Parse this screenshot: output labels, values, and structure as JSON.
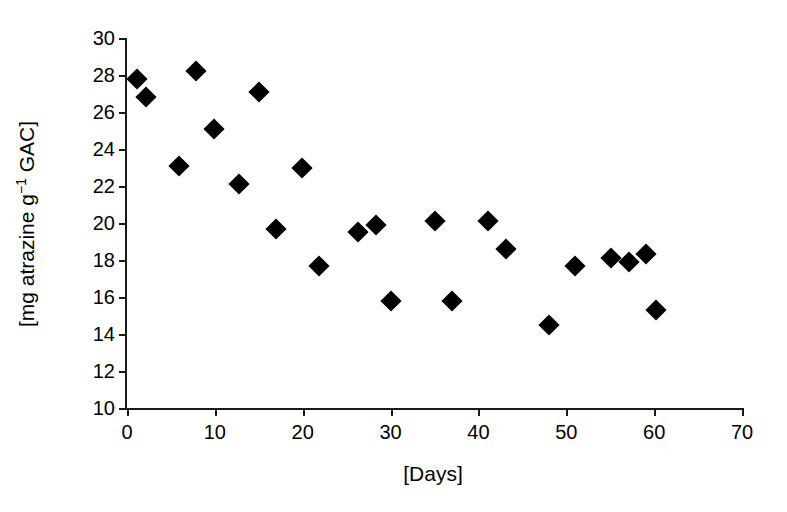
{
  "chart_data": {
    "type": "scatter",
    "title": "",
    "xlabel": "[Days]",
    "ylabel_parts": {
      "prefix": "[mg atrazine g",
      "superscript": "−1",
      "suffix": " GAC]"
    },
    "ylabel": "[mg atrazine g −1 GAC]",
    "xlim": [
      0,
      70
    ],
    "ylim": [
      10,
      30
    ],
    "xticks": [
      0,
      10,
      20,
      30,
      40,
      50,
      60,
      70
    ],
    "yticks": [
      10,
      12,
      14,
      16,
      18,
      20,
      22,
      24,
      26,
      28,
      30
    ],
    "xtick_labels": [
      "0",
      "10",
      "20",
      "30",
      "40",
      "50",
      "60",
      "70"
    ],
    "ytick_labels": [
      "10",
      "12",
      "14",
      "16",
      "18",
      "20",
      "22",
      "24",
      "26",
      "28",
      "30"
    ],
    "grid": false,
    "legend": null,
    "marker": {
      "shape": "diamond",
      "color": "#000000",
      "size": 15
    },
    "series": [
      {
        "name": "atrazine loading",
        "color": "#000000",
        "points": [
          {
            "x": 1.1,
            "y": 27.8
          },
          {
            "x": 2.2,
            "y": 26.8
          },
          {
            "x": 5.9,
            "y": 23.1
          },
          {
            "x": 7.9,
            "y": 28.2
          },
          {
            "x": 9.9,
            "y": 25.1
          },
          {
            "x": 12.8,
            "y": 22.1
          },
          {
            "x": 15.0,
            "y": 27.1
          },
          {
            "x": 17.0,
            "y": 19.7
          },
          {
            "x": 19.9,
            "y": 23.0
          },
          {
            "x": 21.9,
            "y": 17.7
          },
          {
            "x": 26.3,
            "y": 19.5
          },
          {
            "x": 28.3,
            "y": 19.9
          },
          {
            "x": 30.1,
            "y": 15.8
          },
          {
            "x": 35.1,
            "y": 20.1
          },
          {
            "x": 37.0,
            "y": 15.8
          },
          {
            "x": 41.1,
            "y": 20.1
          },
          {
            "x": 43.1,
            "y": 18.6
          },
          {
            "x": 48.0,
            "y": 14.5
          },
          {
            "x": 51.0,
            "y": 17.7
          },
          {
            "x": 55.1,
            "y": 18.1
          },
          {
            "x": 57.1,
            "y": 17.9
          },
          {
            "x": 59.1,
            "y": 18.3
          },
          {
            "x": 60.2,
            "y": 15.3
          }
        ]
      }
    ]
  }
}
